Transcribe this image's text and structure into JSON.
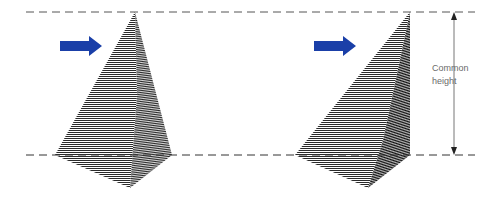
{
  "diagram": {
    "label": {
      "line1": "Common",
      "line2": "height"
    },
    "colors": {
      "arrow": "#1a3fa8",
      "guide_line": "#555555",
      "hatch": "#222222",
      "label_text": "#6a6a6a"
    },
    "shapes": [
      {
        "id": "left-pyramid",
        "type": "pyramid",
        "apex": "centered"
      },
      {
        "id": "right-pyramid",
        "type": "pyramid",
        "apex": "offset-right"
      }
    ],
    "arrows": [
      {
        "id": "left-arrow",
        "direction": "right"
      },
      {
        "id": "right-arrow",
        "direction": "right"
      }
    ],
    "guides": [
      {
        "id": "top-guide",
        "style": "dashed"
      },
      {
        "id": "bottom-guide",
        "style": "dashed"
      }
    ],
    "dimension": {
      "id": "common-height-dimension",
      "direction": "vertical",
      "arrowheads": "both"
    }
  }
}
